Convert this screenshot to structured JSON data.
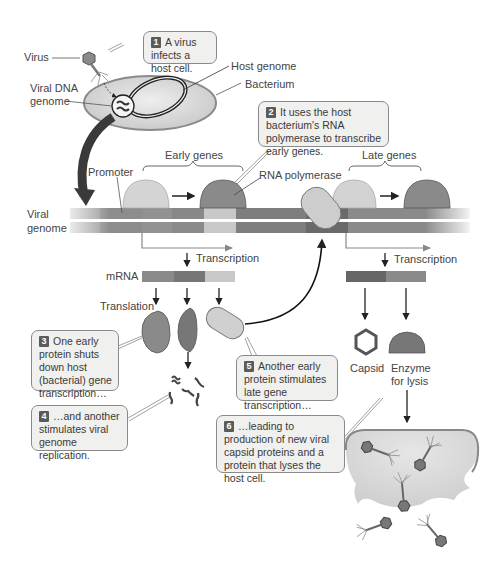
{
  "figure": {
    "labels": {
      "virus": "Virus",
      "viral_dna_genome_line1": "Viral DNA",
      "viral_dna_genome_line2": "genome",
      "host_genome": "Host genome",
      "bacterium": "Bacterium",
      "promoter": "Promoter",
      "early_genes": "Early genes",
      "rna_polymerase": "RNA polymerase",
      "late_genes": "Late genes",
      "viral_genome_line1": "Viral",
      "viral_genome_line2": "genome",
      "transcription_early": "Transcription",
      "transcription_late": "Transcription",
      "mrna": "mRNA",
      "translation": "Translation",
      "capsid": "Capsid",
      "enzyme_line1": "Enzyme",
      "enzyme_line2": "for lysis"
    },
    "steps": [
      {
        "number": "1",
        "text": "A virus infects a host cell."
      },
      {
        "number": "2",
        "text": "It uses the host bacterium's RNA polymerase to transcribe early genes."
      },
      {
        "number": "3",
        "text": "One early protein shuts down host (bacterial) gene transcription…"
      },
      {
        "number": "4",
        "text": "…and another stimulates viral genome replication."
      },
      {
        "number": "5",
        "text": "Another early protein stimulates late gene transcription…"
      },
      {
        "number": "6",
        "text": "…leading to production of new viral capsid proteins and a protein that lyses the host cell."
      }
    ],
    "colors": {
      "light_gray": "#d6d6d6",
      "mid_gray": "#8c8c8c",
      "dark_gray": "#6a6a6a",
      "callout_bg": "#f0f0ee",
      "badge": "#5b5b5b"
    }
  }
}
